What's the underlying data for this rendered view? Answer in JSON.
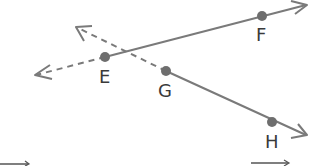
{
  "diagram": {
    "type": "geometry-lines",
    "colors": {
      "line": "#7a7a7a",
      "point": "#6e6e6e",
      "label": "#3a3a3a",
      "background": "#ffffff"
    },
    "points": [
      {
        "name": "E",
        "x": 105,
        "y": 57
      },
      {
        "name": "F",
        "x": 262,
        "y": 16
      },
      {
        "name": "G",
        "x": 166,
        "y": 71
      },
      {
        "name": "H",
        "x": 272,
        "y": 122
      }
    ],
    "labels": {
      "E": "E",
      "F": "F",
      "G": "G",
      "H": "H"
    },
    "lines": [
      {
        "name": "line-EF",
        "through": [
          "E",
          "F"
        ],
        "solid_from": "E",
        "dashed_toward": "left",
        "arrows": "both"
      },
      {
        "name": "line-GH",
        "through": [
          "G",
          "H"
        ],
        "solid_from": "G",
        "dashed_toward": "upper-left",
        "arrows": "both"
      }
    ],
    "bottom_fragments": [
      "arrow-fragment-left",
      "arrow-fragment-right"
    ]
  }
}
